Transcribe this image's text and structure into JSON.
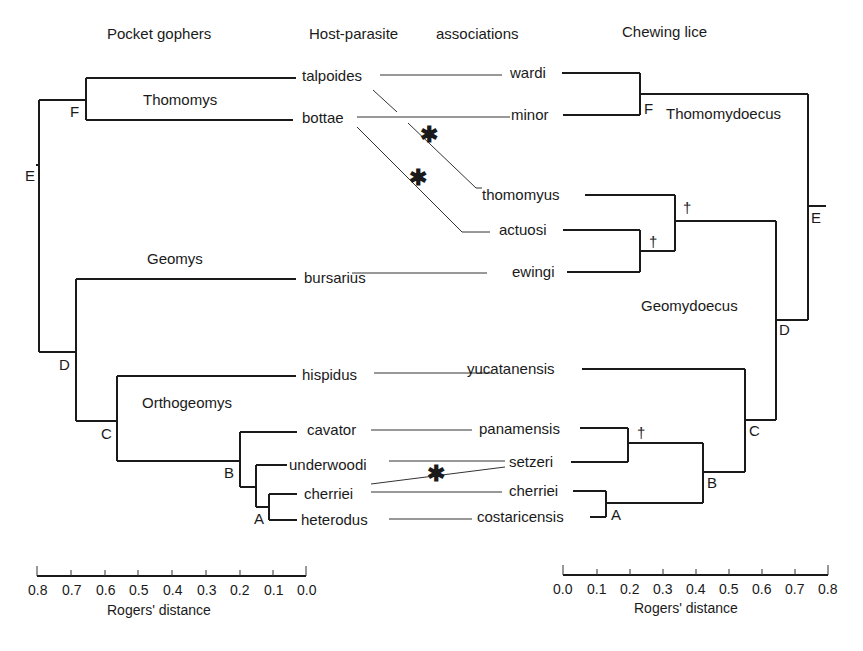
{
  "headers": {
    "left": "Pocket gophers",
    "middle_1": "Host-parasite",
    "middle_2": "associations",
    "right": "Chewing lice"
  },
  "host_tree": {
    "genera": [
      "Thomomys",
      "Geomys",
      "Orthogeomys"
    ],
    "taxa": [
      "talpoides",
      "bottae",
      "bursarius",
      "hispidus",
      "cavator",
      "underwoodi",
      "cherriei",
      "heterodus"
    ],
    "nodes": [
      "F",
      "E",
      "D",
      "C",
      "B",
      "A"
    ]
  },
  "parasite_tree": {
    "genera": [
      "Thomomydoecus",
      "Geomydoecus"
    ],
    "taxa": [
      "wardi",
      "minor",
      "thomomyus",
      "actuosi",
      "ewingi",
      "yucatanensis",
      "panamensis",
      "setzeri",
      "cherriei",
      "costaricensis"
    ],
    "nodes": [
      "F",
      "E",
      "D",
      "C",
      "B",
      "A"
    ]
  },
  "associations": [
    {
      "host": "talpoides",
      "parasite": "wardi",
      "host_switch": false
    },
    {
      "host": "talpoides",
      "parasite": "thomomyus",
      "host_switch": true
    },
    {
      "host": "bottae",
      "parasite": "minor",
      "host_switch": false
    },
    {
      "host": "bottae",
      "parasite": "actuosi",
      "host_switch": true
    },
    {
      "host": "bursarius",
      "parasite": "ewingi",
      "host_switch": false
    },
    {
      "host": "hispidus",
      "parasite": "yucatanensis",
      "host_switch": false
    },
    {
      "host": "cavator",
      "parasite": "panamensis",
      "host_switch": false
    },
    {
      "host": "underwoodi",
      "parasite": "setzeri",
      "host_switch": false
    },
    {
      "host": "cherriei",
      "parasite": "setzeri",
      "host_switch": true
    },
    {
      "host": "cherriei",
      "parasite": "cherriei",
      "host_switch": false
    },
    {
      "host": "heterodus",
      "parasite": "costaricensis",
      "host_switch": false
    }
  ],
  "markers": {
    "host_switch": "✱",
    "extinction": "†"
  },
  "scales": {
    "left": {
      "ticks": [
        "0.8",
        "0.7",
        "0.6",
        "0.5",
        "0.4",
        "0.3",
        "0.2",
        "0.1",
        "0.0"
      ],
      "title": "Rogers' distance"
    },
    "right": {
      "ticks": [
        "0.0",
        "0.1",
        "0.2",
        "0.3",
        "0.4",
        "0.5",
        "0.6",
        "0.7",
        "0.8"
      ],
      "title": "Rogers' distance"
    }
  }
}
